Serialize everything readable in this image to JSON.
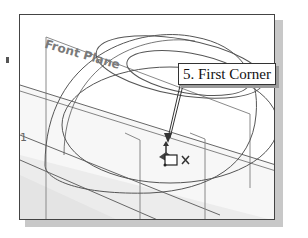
{
  "callout": {
    "text": "5. First Corner"
  },
  "viewport": {
    "plane_label": "Front Plane",
    "edge_label": "1",
    "cursor_icon": "rectangle-first-corner-cursor",
    "triad_icon": "origin-triad",
    "endpoint_icon": "coincident-marker"
  },
  "colors": {
    "frame": "#444444",
    "shadow": "#c8c8c8",
    "sketch_lines": "#555555",
    "plane_fill": "#f0f0f0",
    "plane_edge": "#8a8a8a",
    "label_gray": "#7a7a7a"
  }
}
